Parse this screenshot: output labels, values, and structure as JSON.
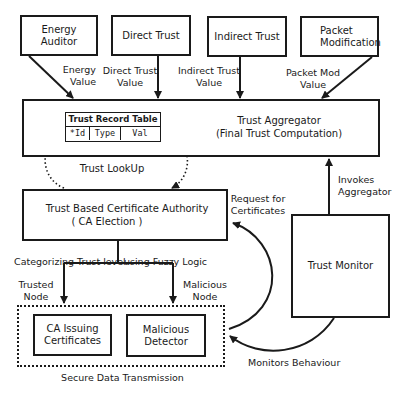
{
  "diagram": {
    "top_boxes": [
      {
        "id": "energy-auditor",
        "label": "Energy Auditor",
        "output_label": "Energy\nValue"
      },
      {
        "id": "direct-trust",
        "label": "Direct Trust",
        "output_label": "Direct Trust\nValue"
      },
      {
        "id": "indirect-trust",
        "label": "Indirect Trust",
        "output_label": "Indirect Trust\nValue"
      },
      {
        "id": "packet-modification",
        "label": "Packet\nModification",
        "output_label": "Packet Mod\nValue"
      }
    ],
    "aggregator": {
      "title": "Trust Aggregator",
      "subtitle": "(Final Trust Computation)"
    },
    "trust_record_table": {
      "title": "Trust Record Table",
      "columns": [
        "*Id",
        "Type",
        "Val"
      ]
    },
    "lookup_label": "Trust LookUp",
    "certificate_authority": {
      "title": "Trust Based Certificate Authority",
      "subtitle": "( CA Election )"
    },
    "trust_monitor": {
      "label": "Trust Monitor"
    },
    "invokes_label": "Invokes\nAggregator",
    "request_label": "Request  for\nCertificates",
    "categorize_left": "Categorizing Trust level",
    "categorize_right": "using Fuzzy Logic",
    "trusted_label": "Trusted\nNode",
    "malicious_label": "Malicious\nNode",
    "secure_group": {
      "label": "Secure Data Transmission",
      "boxes": [
        {
          "id": "ca-issuing",
          "label": "CA Issuing\nCertificates"
        },
        {
          "id": "malicious-detector",
          "label": "Malicious\nDetector"
        }
      ]
    },
    "monitors_label": "Monitors Behaviour"
  },
  "colors": {
    "stroke": "#1a1a1a",
    "background": "#ffffff"
  }
}
